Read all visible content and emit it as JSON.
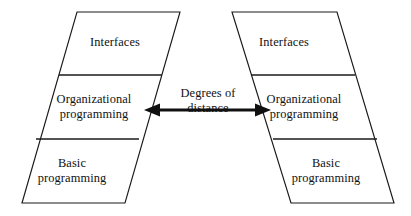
{
  "diagram": {
    "stroke_color": "#1a1a1a",
    "fill_color": "#ffffff",
    "arrow_color": "#101010",
    "left_stack": {
      "name": "left-parallelogram",
      "bands": [
        {
          "id": "interfaces",
          "label": "Interfaces"
        },
        {
          "id": "organizational-programming",
          "label": "Organizational\nprogramming"
        },
        {
          "id": "basic-programming",
          "label": "Basic\nprogramming"
        }
      ]
    },
    "right_stack": {
      "name": "right-parallelogram",
      "bands": [
        {
          "id": "interfaces",
          "label": "Interfaces"
        },
        {
          "id": "organizational-programming",
          "label": "Organizational\nprogramming"
        },
        {
          "id": "basic-programming",
          "label": "Basic\nprogramming"
        }
      ]
    },
    "connector": {
      "label": "Degrees of\ndistance",
      "type": "double-headed-arrow"
    }
  },
  "geometry": {
    "left_outline": "77,12 180,12 125,203 22,203",
    "left_divider_upper": "59,75 162,75",
    "left_divider_lower": "36,139 139,139",
    "right_outline": "232,12 337,12 394,203 291,203",
    "right_divider_upper": "251,75 355,75",
    "right_divider_lower": "273,139 377,139",
    "arrow_shaft": "153,110 262,110",
    "arrow_head_left": "144,110 159,104.5 159,115.5",
    "arrow_head_right": "271,110 256,104.5 256,115.5"
  }
}
